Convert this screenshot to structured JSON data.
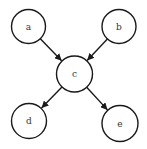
{
  "diagram": {
    "type": "directed-graph",
    "nodes": [
      {
        "id": "a",
        "label": "a",
        "cx": 28.5,
        "cy": 26.5,
        "r": 17
      },
      {
        "id": "b",
        "label": "b",
        "cx": 119,
        "cy": 26.5,
        "r": 17
      },
      {
        "id": "c",
        "label": "c",
        "cx": 74.5,
        "cy": 74,
        "r": 18
      },
      {
        "id": "d",
        "label": "d",
        "cx": 29,
        "cy": 121,
        "r": 17.5
      },
      {
        "id": "e",
        "label": "e",
        "cx": 120,
        "cy": 123.5,
        "r": 18
      }
    ],
    "edges": [
      {
        "from": "a",
        "to": "c"
      },
      {
        "from": "b",
        "to": "c"
      },
      {
        "from": "c",
        "to": "d"
      },
      {
        "from": "c",
        "to": "e"
      }
    ],
    "colors": {
      "stroke": "#1a1a1a",
      "fill": "#ffffff",
      "text": "#333333"
    }
  }
}
